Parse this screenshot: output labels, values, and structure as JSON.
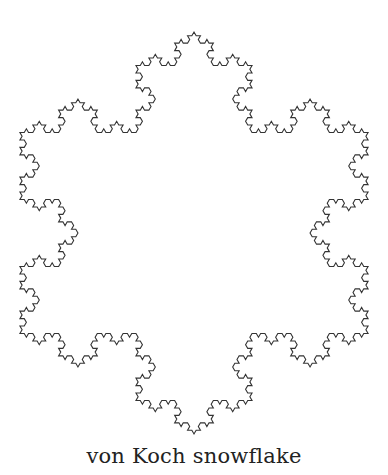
{
  "figure": {
    "title": "von Koch snowflake",
    "shape": "koch-snowflake",
    "iterations": 4,
    "center": [
      194,
      233
    ],
    "radius": 201,
    "orientation": "point-up",
    "stroke_color": "#333333",
    "stroke_width": 1.1,
    "background": "#ffffff"
  },
  "caption": {
    "text": "von Koch snowflake"
  }
}
